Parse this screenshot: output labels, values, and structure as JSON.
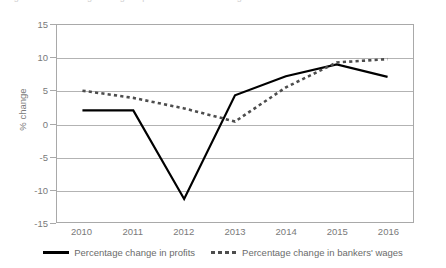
{
  "top_caption": "Figure 1.4  Percentage change in profits and bankers' wages over time",
  "chart_data": {
    "type": "line",
    "title": "",
    "xlabel": "",
    "ylabel": "% change",
    "categories": [
      "2010",
      "2011",
      "2012",
      "2013",
      "2014",
      "2015",
      "2016"
    ],
    "x": [
      2010,
      2011,
      2012,
      2013,
      2014,
      2015,
      2016
    ],
    "ylim": [
      -15,
      15
    ],
    "yticks": [
      "15",
      "10",
      "5",
      "0",
      "-5",
      "-10",
      "-15"
    ],
    "ytick_values": [
      15,
      10,
      5,
      0,
      -5,
      -10,
      -15
    ],
    "grid": true,
    "legend_position": "bottom",
    "series": [
      {
        "name": "Percentage change in profits",
        "style": "solid",
        "color": "#000000",
        "values": [
          2.0,
          2.0,
          -11.5,
          4.3,
          7.2,
          9.0,
          7.1
        ]
      },
      {
        "name": "Percentage change in bankers' wages",
        "style": "dashed",
        "color": "#4d4d4d",
        "values": [
          5.0,
          3.9,
          2.3,
          0.3,
          5.5,
          9.3,
          9.8
        ]
      }
    ]
  },
  "axis": {
    "y_label": "% change"
  },
  "legend": {
    "items": [
      {
        "label": "Percentage change in profits"
      },
      {
        "label": "Percentage change in bankers' wages"
      }
    ]
  }
}
